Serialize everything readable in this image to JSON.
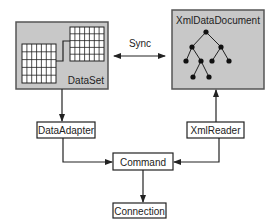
{
  "colors": {
    "panel_fill": "#c8c8c8",
    "panel_stroke": "#555555",
    "box_fill": "#ffffff",
    "line": "#222222",
    "grid_fill": "#ffffff"
  },
  "nodes": {
    "dataset": {
      "label": "DataSet"
    },
    "xmldatadocument": {
      "label": "XmlDataDocument"
    },
    "dataadapter": {
      "label": "DataAdapter"
    },
    "xmlreader": {
      "label": "XmlReader"
    },
    "command": {
      "label": "Command"
    },
    "connection": {
      "label": "Connection"
    }
  },
  "edges": {
    "sync": {
      "label": "Sync",
      "from": "DataSet",
      "to": "XmlDataDocument",
      "bidirectional": true
    },
    "dataset_to_dataadapter": {
      "from": "DataSet",
      "to": "DataAdapter"
    },
    "xmlreader_to_xmldatadocument": {
      "from": "XmlReader",
      "to": "XmlDataDocument"
    },
    "dataadapter_to_command": {
      "from": "DataAdapter",
      "to": "Command"
    },
    "xmlreader_to_command": {
      "from": "XmlReader",
      "to": "Command"
    },
    "command_to_connection": {
      "from": "Command",
      "to": "Connection"
    }
  },
  "icons": {
    "dataset_tables": "data-tables-icon",
    "xml_tree": "tree-icon"
  }
}
